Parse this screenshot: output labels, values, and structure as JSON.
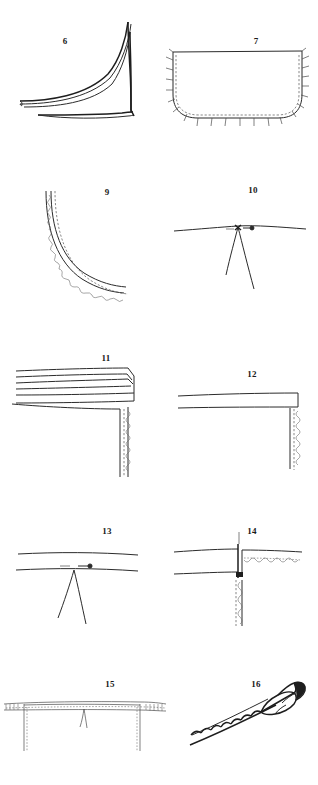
{
  "page": {
    "kind": "illustration-plate",
    "background_color": "#ffffff",
    "ink_color": "#2b2b2b",
    "columns": 2,
    "rows": 5
  },
  "figures": [
    {
      "number": "6",
      "label": "6",
      "caption": "",
      "icon": "curved-pointed-fabric-shape",
      "description": "Two long tapering curved strips rising to a point at right, resting on a horizontal base line",
      "column": "left",
      "row": 1
    },
    {
      "number": "7",
      "label": "7",
      "caption": "",
      "icon": "rounded-pocket-with-basting-stitches",
      "description": "Rounded rectangular pocket outline with dashed inner seam line and tick stitch marks radiating outward along curved bottom and sides",
      "column": "right",
      "row": 1
    },
    {
      "number": "9",
      "label": "9",
      "caption": "",
      "icon": "curved-seam-with-scalloped-edge",
      "description": "Quarter-circle curve drawn with a solid line, a parallel dashed line and a scalloped overcast edge",
      "column": "left",
      "row": 2
    },
    {
      "number": "10",
      "label": "10",
      "caption": "",
      "icon": "dart-with-pin",
      "description": "Horizontal fabric edge with a V-shaped dart descending from a point, with a small pin laid across the dart point",
      "column": "right",
      "row": 2
    },
    {
      "number": "11",
      "label": "11",
      "caption": "",
      "icon": "folded-hem-corner",
      "description": "Multi-fold hem band shown in perspective meeting a vertical scalloped raw edge at the corner",
      "column": "left",
      "row": 3
    },
    {
      "number": "12",
      "label": "12",
      "caption": "",
      "icon": "plain-hem-corner",
      "description": "Single hem band meeting a vertical dashed and scalloped raw edge at the corner",
      "column": "right",
      "row": 3
    },
    {
      "number": "13",
      "label": "13",
      "caption": "",
      "icon": "dart-between-two-seam-lines",
      "description": "Two horizontal seam lines with a V-shaped dart descending from the lower line and two pin marks above it",
      "column": "left",
      "row": 4
    },
    {
      "number": "14",
      "label": "14",
      "caption": "",
      "icon": "seam-junction-with-scalloped-edges",
      "description": "Two horizontal bands meeting a vertical seam with a scalloped edge running right and a dashed scalloped edge running down",
      "column": "right",
      "row": 4
    },
    {
      "number": "15",
      "label": "15",
      "caption": "",
      "icon": "waistband-with-two-darts",
      "description": "Horizontal waistband with stitch marks, two vertical seam lines descending and a small dart in the middle",
      "column": "left",
      "row": 5
    },
    {
      "number": "16",
      "label": "16",
      "caption": "",
      "icon": "rolled-piping-strip",
      "description": "Diagonal narrow strip with a scalloped upper edge and a rolled folded end at the upper right",
      "column": "right",
      "row": 5
    }
  ]
}
